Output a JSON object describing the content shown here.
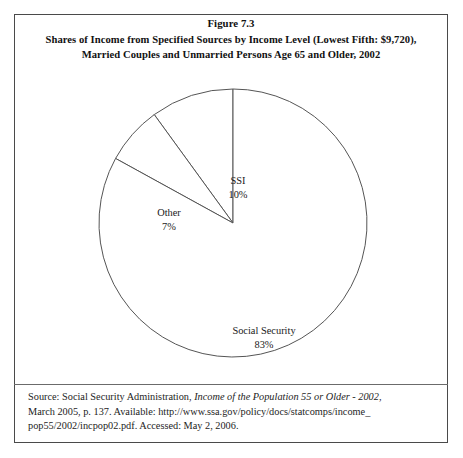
{
  "figure": {
    "title_lines": [
      "Figure 7.3",
      "Shares of Income from Specified Sources by Income Level (Lowest Fifth: $9,720),",
      "Married Couples and Unmarried Persons Age 65 and Older, 2002"
    ],
    "border_color": "#4a4a4a",
    "background_color": "#ffffff"
  },
  "chart_data": {
    "type": "pie",
    "xlabel": "",
    "ylabel": "",
    "categories": [
      "SSI",
      "Other",
      "Social Security"
    ],
    "values": [
      10,
      7,
      83
    ],
    "value_unit": "%",
    "labels": [
      {
        "name": "SSI",
        "value": "10%"
      },
      {
        "name": "Other",
        "value": "7%"
      },
      {
        "name": "Social Security",
        "value": "83%"
      }
    ],
    "start_angle_deg": 90,
    "direction": "counterclockwise",
    "slice_fill": "#ffffff",
    "slice_stroke": "#555555",
    "legend": "none",
    "grid": false,
    "labels_position": "inside"
  },
  "source": {
    "lines": [
      "Source: Social Security Administration, ",
      "March 2005, p. 137. Available: http://www.ssa.gov/policy/docs/statcomps/income_",
      "pop55/2002/incpop02.pdf. Accessed: May 2, 2006."
    ],
    "italic_part": "Income of the Population 55 or Older - 2002,",
    "divider_color": "#6b6b6b"
  }
}
